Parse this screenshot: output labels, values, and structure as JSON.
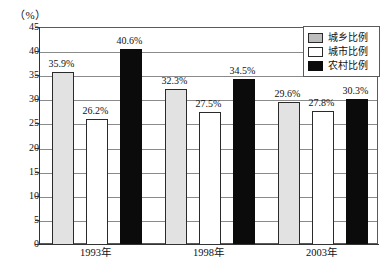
{
  "chart_data": {
    "type": "bar",
    "title": "",
    "unit_label": "（%）",
    "xlabel": "",
    "ylabel": "",
    "ylim": [
      0,
      45
    ],
    "ytick_step": 5,
    "ytick_labels": [
      "0",
      "5",
      "10",
      "15",
      "20",
      "25",
      "30",
      "35",
      "40",
      "45"
    ],
    "grid": true,
    "legend_position": "top-right",
    "categories": [
      "1993年",
      "1998年",
      "2003年"
    ],
    "series": [
      {
        "name": "城乡比例",
        "color": "#e2e2e2",
        "values": [
          35.9,
          32.3,
          29.6
        ],
        "labels": [
          "35.9%",
          "32.3%",
          "29.6%"
        ]
      },
      {
        "name": "城市比例",
        "color": "#ffffff",
        "values": [
          26.2,
          27.5,
          27.8
        ],
        "labels": [
          "26.2%",
          "27.5%",
          "27.8%"
        ]
      },
      {
        "name": "农村比例",
        "color": "#0b0b0b",
        "values": [
          40.6,
          34.5,
          30.3
        ],
        "labels": [
          "40.6%",
          "34.5%",
          "30.3%"
        ]
      }
    ]
  }
}
